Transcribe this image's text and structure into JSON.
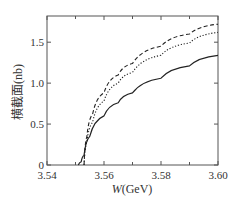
{
  "chart_data": {
    "type": "line",
    "title": "",
    "xlabel": "W(GeV)",
    "xlabel_italic": "W",
    "xlabel_unit": "(GeV)",
    "ylabel": "横截面(nb)",
    "xlim": [
      3.54,
      3.6
    ],
    "ylim": [
      0,
      1.82
    ],
    "xticks": [
      "3.54",
      "3.56",
      "3.58",
      "3.60"
    ],
    "yticks": [
      "0",
      "0.5",
      "1.0",
      "1.5"
    ],
    "grid": false,
    "legend": null,
    "series": [
      {
        "name": "dashed",
        "style": "dashed",
        "x": [
          3.553,
          3.554,
          3.556,
          3.56,
          3.565,
          3.57,
          3.58,
          3.59,
          3.6
        ],
        "y": [
          0.0,
          0.35,
          0.62,
          0.88,
          1.1,
          1.24,
          1.45,
          1.6,
          1.72
        ]
      },
      {
        "name": "dotted",
        "style": "dotted",
        "x": [
          3.553,
          3.554,
          3.556,
          3.56,
          3.565,
          3.57,
          3.58,
          3.59,
          3.6
        ],
        "y": [
          0.0,
          0.28,
          0.52,
          0.78,
          1.0,
          1.13,
          1.34,
          1.49,
          1.62
        ]
      },
      {
        "name": "solid",
        "style": "solid",
        "x": [
          3.551,
          3.552,
          3.553,
          3.555,
          3.56,
          3.565,
          3.57,
          3.58,
          3.59,
          3.6
        ],
        "y": [
          0.0,
          0.04,
          0.12,
          0.35,
          0.6,
          0.76,
          0.88,
          1.06,
          1.21,
          1.34
        ]
      }
    ]
  }
}
